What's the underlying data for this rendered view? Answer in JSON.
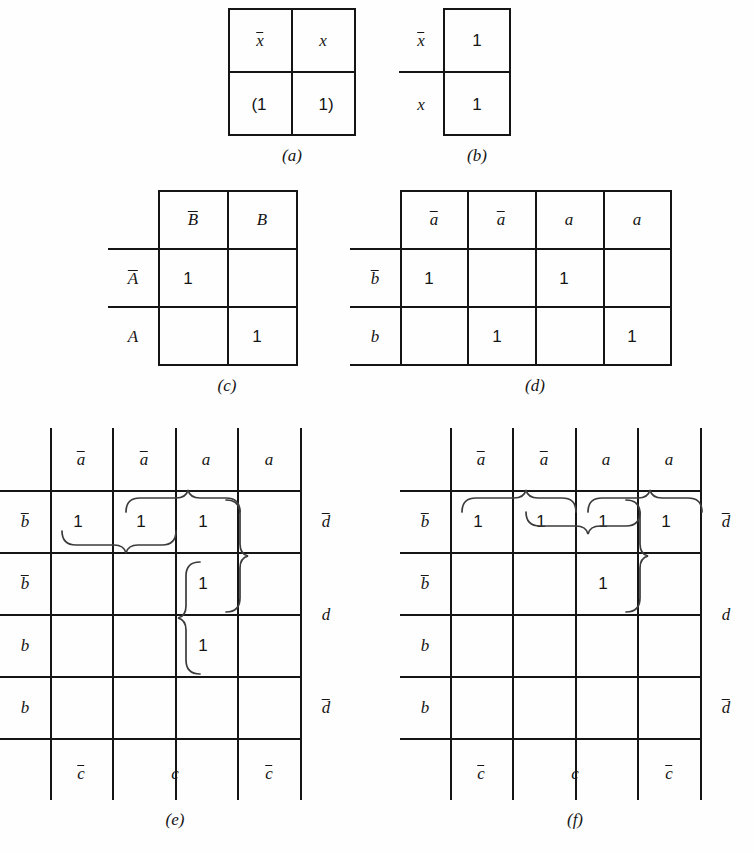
{
  "figure": {
    "ink_color": "#151515",
    "brace_color": "#3b3b3b",
    "background": "#fefefe"
  },
  "panels": [
    {
      "id": "a",
      "caption": "(a)",
      "rows": 2,
      "cols": 2,
      "col_headers": [
        "x̅",
        "x"
      ],
      "row_headers": [],
      "cells": [
        [
          "",
          ""
        ],
        [
          "(1",
          "1)"
        ]
      ],
      "notes": "Two-cell map, top row holds the variable labels, bottom row holds the grouped ones in parentheses."
    },
    {
      "id": "b",
      "caption": "(b)",
      "rows": 2,
      "cols": 1,
      "col_headers": [],
      "row_headers": [
        "x̅",
        "x"
      ],
      "cells": [
        [
          "1"
        ],
        [
          "1"
        ]
      ],
      "notes": "Single column map with two rows, both containing 1."
    },
    {
      "id": "c",
      "caption": "(c)",
      "rows": 2,
      "cols": 2,
      "col_headers": [
        "B̅",
        "B"
      ],
      "row_headers": [
        "A̅",
        "A"
      ],
      "cells": [
        [
          "1",
          ""
        ],
        [
          "",
          "1"
        ]
      ],
      "notes": "Two-variable map with ones on the diagonal."
    },
    {
      "id": "d",
      "caption": "(d)",
      "rows": 2,
      "cols": 4,
      "col_headers": [
        "a̅",
        "a̅",
        "a",
        "a"
      ],
      "row_headers": [
        "b̅",
        "b"
      ],
      "cells": [
        [
          "1",
          "",
          "1",
          ""
        ],
        [
          "",
          "1",
          "",
          "1"
        ]
      ],
      "notes": "Two by four map with ones in a checkerboard pattern."
    },
    {
      "id": "e",
      "caption": "(e)",
      "rows": 4,
      "cols": 4,
      "col_headers": [
        "a̅",
        "a̅",
        "a",
        "a"
      ],
      "row_headers": [
        "b̅",
        "b̅",
        "b",
        "b"
      ],
      "right_headers": [
        "d̅",
        "d",
        "d",
        "d̅"
      ],
      "bottom_headers": [
        "c̅",
        "c",
        "c̅"
      ],
      "cells": [
        [
          "1",
          "1",
          "1",
          ""
        ],
        [
          "",
          "",
          "1",
          ""
        ],
        [
          "",
          "",
          "1",
          ""
        ],
        [
          "",
          "",
          "",
          ""
        ]
      ],
      "braces": [
        {
          "name": "horizontal-pair-row1-cols1-2",
          "orientation": "down",
          "span_cells": "r1c1-r1c2"
        },
        {
          "name": "horizontal-pair-row1-cols2-3",
          "orientation": "up",
          "span_cells": "r1c2-r1c3"
        },
        {
          "name": "vertical-pair-col3-rows1-2",
          "orientation": "right",
          "span_cells": "r1c3-r2c3"
        },
        {
          "name": "vertical-pair-col3-rows2-3",
          "orientation": "left",
          "span_cells": "r2c3-r3c3"
        }
      ]
    },
    {
      "id": "f",
      "caption": "(f)",
      "rows": 4,
      "cols": 4,
      "col_headers": [
        "a̅",
        "a̅",
        "a",
        "a"
      ],
      "row_headers": [
        "b̅",
        "b̅",
        "b",
        "b"
      ],
      "right_headers": [
        "d̅",
        "d",
        "d",
        "d̅"
      ],
      "bottom_headers": [
        "c̅",
        "c",
        "c̅"
      ],
      "cells": [
        [
          "1",
          "1",
          "1",
          "1"
        ],
        [
          "",
          "",
          "1",
          ""
        ],
        [
          "",
          "",
          "",
          ""
        ],
        [
          "",
          "",
          "",
          ""
        ]
      ],
      "braces": [
        {
          "name": "horizontal-pair-row1-cols1-2",
          "orientation": "up",
          "span_cells": "r1c1-r1c2"
        },
        {
          "name": "horizontal-pair-row1-cols2-3",
          "orientation": "down",
          "span_cells": "r1c2-r1c3"
        },
        {
          "name": "horizontal-pair-row1-cols3-4",
          "orientation": "up",
          "span_cells": "r1c3-r1c4"
        },
        {
          "name": "vertical-pair-col3-rows1-2",
          "orientation": "right",
          "span_cells": "r1c3-r2c3"
        }
      ]
    }
  ]
}
